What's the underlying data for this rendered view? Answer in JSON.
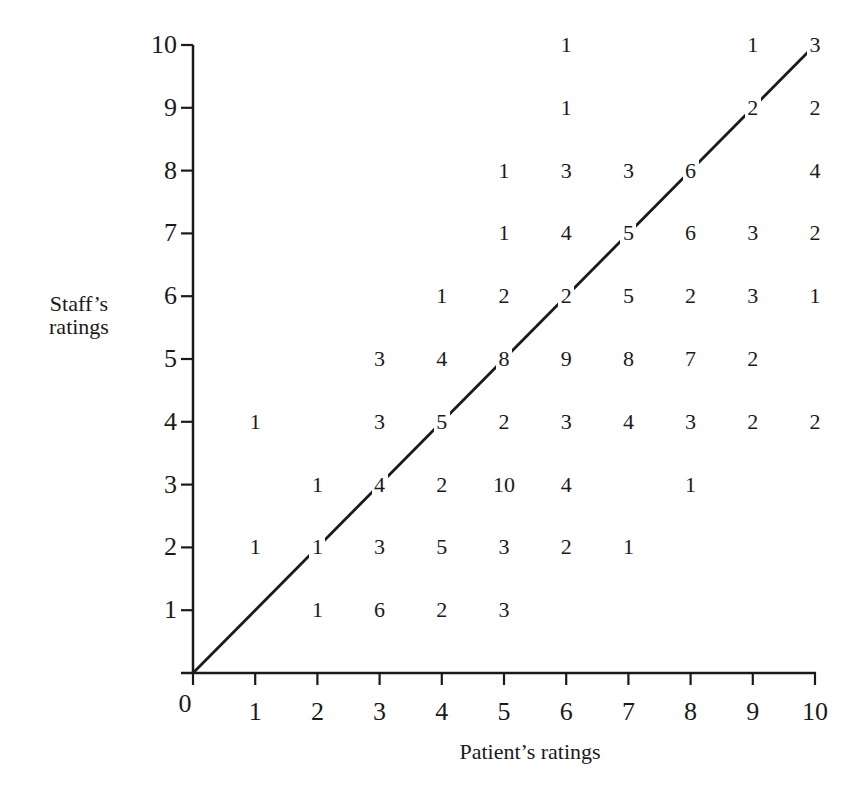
{
  "chart_data": {
    "type": "table",
    "subtype": "scatter-count-grid",
    "title": "",
    "xlabel": "Patient's ratings",
    "ylabel": "Staff's ratings",
    "xlim": [
      0,
      10
    ],
    "ylim": [
      0,
      10
    ],
    "x_ticks": [
      "0",
      "1",
      "2",
      "3",
      "4",
      "5",
      "6",
      "7",
      "8",
      "9",
      "10"
    ],
    "y_ticks": [
      "1",
      "2",
      "3",
      "4",
      "5",
      "6",
      "7",
      "8",
      "9",
      "10"
    ],
    "grid": false,
    "legend": null,
    "reference_line": {
      "type": "identity",
      "from": [
        0,
        0
      ],
      "to": [
        10,
        10
      ],
      "label": "y = x"
    },
    "points": [
      {
        "x": 6,
        "y": 10,
        "count": 1
      },
      {
        "x": 9,
        "y": 10,
        "count": 1
      },
      {
        "x": 10,
        "y": 10,
        "count": 3
      },
      {
        "x": 6,
        "y": 9,
        "count": 1
      },
      {
        "x": 9,
        "y": 9,
        "count": 2
      },
      {
        "x": 10,
        "y": 9,
        "count": 2
      },
      {
        "x": 5,
        "y": 8,
        "count": 1
      },
      {
        "x": 6,
        "y": 8,
        "count": 3
      },
      {
        "x": 7,
        "y": 8,
        "count": 3
      },
      {
        "x": 8,
        "y": 8,
        "count": 6
      },
      {
        "x": 10,
        "y": 8,
        "count": 4
      },
      {
        "x": 5,
        "y": 7,
        "count": 1
      },
      {
        "x": 6,
        "y": 7,
        "count": 4
      },
      {
        "x": 7,
        "y": 7,
        "count": 5
      },
      {
        "x": 8,
        "y": 7,
        "count": 6
      },
      {
        "x": 9,
        "y": 7,
        "count": 3
      },
      {
        "x": 10,
        "y": 7,
        "count": 2
      },
      {
        "x": 4,
        "y": 6,
        "count": 1
      },
      {
        "x": 5,
        "y": 6,
        "count": 2
      },
      {
        "x": 6,
        "y": 6,
        "count": 2
      },
      {
        "x": 7,
        "y": 6,
        "count": 5
      },
      {
        "x": 8,
        "y": 6,
        "count": 2
      },
      {
        "x": 9,
        "y": 6,
        "count": 3
      },
      {
        "x": 10,
        "y": 6,
        "count": 1
      },
      {
        "x": 3,
        "y": 5,
        "count": 3
      },
      {
        "x": 4,
        "y": 5,
        "count": 4
      },
      {
        "x": 5,
        "y": 5,
        "count": 8
      },
      {
        "x": 6,
        "y": 5,
        "count": 9
      },
      {
        "x": 7,
        "y": 5,
        "count": 8
      },
      {
        "x": 8,
        "y": 5,
        "count": 7
      },
      {
        "x": 9,
        "y": 5,
        "count": 2
      },
      {
        "x": 1,
        "y": 4,
        "count": 1
      },
      {
        "x": 3,
        "y": 4,
        "count": 3
      },
      {
        "x": 4,
        "y": 4,
        "count": 5
      },
      {
        "x": 5,
        "y": 4,
        "count": 2
      },
      {
        "x": 6,
        "y": 4,
        "count": 3
      },
      {
        "x": 7,
        "y": 4,
        "count": 4
      },
      {
        "x": 8,
        "y": 4,
        "count": 3
      },
      {
        "x": 9,
        "y": 4,
        "count": 2
      },
      {
        "x": 10,
        "y": 4,
        "count": 2
      },
      {
        "x": 2,
        "y": 3,
        "count": 1
      },
      {
        "x": 3,
        "y": 3,
        "count": 4
      },
      {
        "x": 4,
        "y": 3,
        "count": 2
      },
      {
        "x": 5,
        "y": 3,
        "count": 10
      },
      {
        "x": 6,
        "y": 3,
        "count": 4
      },
      {
        "x": 8,
        "y": 3,
        "count": 1
      },
      {
        "x": 1,
        "y": 2,
        "count": 1
      },
      {
        "x": 2,
        "y": 2,
        "count": 1
      },
      {
        "x": 3,
        "y": 2,
        "count": 3
      },
      {
        "x": 4,
        "y": 2,
        "count": 5
      },
      {
        "x": 5,
        "y": 2,
        "count": 3
      },
      {
        "x": 6,
        "y": 2,
        "count": 2
      },
      {
        "x": 7,
        "y": 2,
        "count": 1
      },
      {
        "x": 2,
        "y": 1,
        "count": 1
      },
      {
        "x": 3,
        "y": 1,
        "count": 6
      },
      {
        "x": 4,
        "y": 1,
        "count": 2
      },
      {
        "x": 5,
        "y": 1,
        "count": 3
      }
    ]
  },
  "labels": {
    "x_axis_title": "Patient's ratings",
    "y_axis_title_line1": "Staff’s",
    "y_axis_title_line2": "ratings",
    "x_axis_title_display": "Patient’s ratings",
    "origin": "0"
  },
  "colors": {
    "ink": "#1a1a1a",
    "background": "#ffffff"
  }
}
